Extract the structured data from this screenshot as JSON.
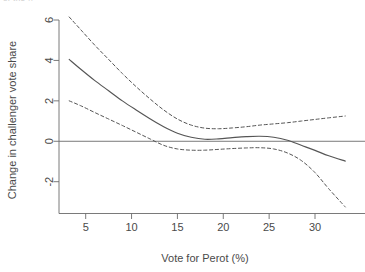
{
  "figure": {
    "clipped_header_text": "of the ..",
    "background_color": "#ffffff",
    "line_color": "#555555",
    "axis_color": "#6b6b6b"
  },
  "chart_data": {
    "type": "line",
    "title": "",
    "xlabel": "Vote for Perot (%)",
    "ylabel": "Change in challenger vote share",
    "xlim": [
      2.0,
      34.0
    ],
    "ylim": [
      -3.6,
      6.6
    ],
    "xticks": [
      5,
      10,
      15,
      20,
      25,
      30
    ],
    "xtick_labels": [
      "5",
      "10",
      "15",
      "20",
      "25",
      "30"
    ],
    "yticks": [
      -2,
      0,
      2,
      4,
      6
    ],
    "ytick_labels": [
      "-2",
      "0",
      "2",
      "4",
      "6"
    ],
    "grid": false,
    "legend": null,
    "reference_lines": [
      {
        "name": "zero-line",
        "orientation": "horizontal",
        "y": 0,
        "style": "solid"
      }
    ],
    "series": [
      {
        "name": "Fitted smooth (challenger vote share change)",
        "style": "solid",
        "x": [
          3.2,
          4.5,
          6.0,
          7.5,
          9.0,
          10.5,
          12.0,
          13.5,
          15.0,
          16.5,
          18.0,
          19.5,
          21.0,
          22.5,
          24.0,
          25.5,
          27.0,
          28.5,
          30.0,
          31.5,
          33.3
        ],
        "y": [
          4.05,
          3.55,
          3.0,
          2.5,
          2.0,
          1.55,
          1.12,
          0.72,
          0.4,
          0.2,
          0.1,
          0.12,
          0.18,
          0.23,
          0.25,
          0.2,
          0.05,
          -0.2,
          -0.45,
          -0.72,
          -0.98
        ]
      },
      {
        "name": "Upper confidence band",
        "style": "dashed",
        "x": [
          3.2,
          4.5,
          6.0,
          7.5,
          9.0,
          10.5,
          12.0,
          13.5,
          15.0,
          16.5,
          18.0,
          19.5,
          21.0,
          22.5,
          24.0,
          25.5,
          27.0,
          28.5,
          30.0,
          31.5,
          33.3
        ],
        "y": [
          6.15,
          5.5,
          4.75,
          4.05,
          3.35,
          2.7,
          2.1,
          1.55,
          1.1,
          0.8,
          0.65,
          0.62,
          0.66,
          0.72,
          0.8,
          0.86,
          0.92,
          1.0,
          1.08,
          1.16,
          1.25
        ]
      },
      {
        "name": "Lower confidence band",
        "style": "dashed",
        "x": [
          3.2,
          4.5,
          6.0,
          7.5,
          9.0,
          10.5,
          12.0,
          13.5,
          15.0,
          16.5,
          18.0,
          19.5,
          21.0,
          22.5,
          24.0,
          25.5,
          27.0,
          28.5,
          30.0,
          31.5,
          33.3
        ],
        "y": [
          2.0,
          1.75,
          1.42,
          1.1,
          0.78,
          0.45,
          0.12,
          -0.2,
          -0.38,
          -0.44,
          -0.44,
          -0.4,
          -0.36,
          -0.33,
          -0.32,
          -0.38,
          -0.58,
          -0.95,
          -1.55,
          -2.35,
          -3.25
        ]
      }
    ]
  }
}
